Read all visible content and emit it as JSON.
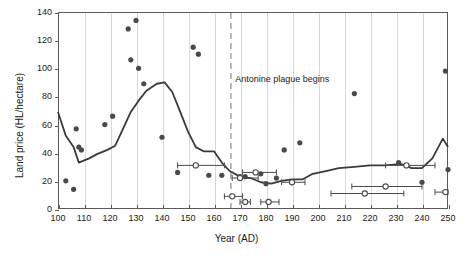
{
  "chart_data": {
    "type": "scatter",
    "title": "",
    "xlabel": "Year (AD)",
    "ylabel": "Land price (HL/hectare)",
    "xlim": [
      100,
      250
    ],
    "ylim": [
      0,
      140
    ],
    "xticks": [
      100,
      110,
      120,
      130,
      140,
      150,
      160,
      170,
      180,
      190,
      200,
      210,
      220,
      230,
      240,
      250
    ],
    "yticks": [
      0,
      20,
      40,
      60,
      80,
      100,
      120,
      140
    ],
    "grid": "vertical",
    "legend": "none",
    "annotations": [
      {
        "text": "Antonine plague begins",
        "x": 167,
        "y": 92,
        "line_x": 166.5,
        "style": "dashed-vertical-gray"
      }
    ],
    "series": [
      {
        "name": "Trend line",
        "type": "line",
        "color": "#3a3a3a",
        "points": [
          [
            100,
            69
          ],
          [
            103,
            52
          ],
          [
            106,
            44
          ],
          [
            108,
            33
          ],
          [
            112,
            36
          ],
          [
            115,
            39
          ],
          [
            119,
            42
          ],
          [
            122,
            45
          ],
          [
            125,
            57
          ],
          [
            128,
            69
          ],
          [
            131,
            77
          ],
          [
            134,
            84
          ],
          [
            138,
            89
          ],
          [
            141,
            90
          ],
          [
            144,
            83
          ],
          [
            147,
            69
          ],
          [
            150,
            55
          ],
          [
            153,
            44
          ],
          [
            156,
            41
          ],
          [
            160,
            41
          ],
          [
            163,
            33
          ],
          [
            166,
            27
          ],
          [
            170,
            23
          ],
          [
            174,
            22
          ],
          [
            178,
            19
          ],
          [
            182,
            18
          ],
          [
            186,
            20
          ],
          [
            190,
            21
          ],
          [
            194,
            21
          ],
          [
            198,
            25
          ],
          [
            203,
            27
          ],
          [
            208,
            29
          ],
          [
            214,
            30
          ],
          [
            220,
            31
          ],
          [
            226,
            31
          ],
          [
            232,
            32
          ],
          [
            236,
            29
          ],
          [
            240,
            29
          ],
          [
            244,
            36
          ],
          [
            248,
            50
          ],
          [
            250,
            44
          ]
        ]
      },
      {
        "name": "Observed land prices (filled)",
        "type": "scatter",
        "marker": "filled-circle",
        "color": "#4a4a4a",
        "points": [
          [
            103,
            20
          ],
          [
            106,
            14
          ],
          [
            107,
            57
          ],
          [
            108,
            44
          ],
          [
            109,
            42
          ],
          [
            118,
            60
          ],
          [
            121,
            66
          ],
          [
            127,
            128
          ],
          [
            128,
            106
          ],
          [
            130,
            134
          ],
          [
            131,
            100
          ],
          [
            133,
            89
          ],
          [
            140,
            51
          ],
          [
            146,
            26
          ],
          [
            152,
            115
          ],
          [
            154,
            110
          ],
          [
            158,
            24
          ],
          [
            163,
            24
          ],
          [
            170,
            23
          ],
          [
            172,
            23
          ],
          [
            178,
            25
          ],
          [
            180,
            18
          ],
          [
            184,
            22
          ],
          [
            187,
            42
          ],
          [
            190,
            19
          ],
          [
            193,
            47
          ],
          [
            214,
            82
          ],
          [
            231,
            33
          ],
          [
            240,
            19
          ],
          [
            249,
            98
          ],
          [
            250,
            28
          ]
        ]
      },
      {
        "name": "Price range estimates (open)",
        "type": "scatter-with-range",
        "marker": "open-circle",
        "color": "#4a4a4a",
        "points": [
          {
            "x": 153,
            "y": 31,
            "x_low": 146,
            "x_high": 164
          },
          {
            "x": 167,
            "y": 9,
            "x_low": 164,
            "x_high": 171
          },
          {
            "x": 170,
            "y": 22,
            "x_low": 167,
            "x_high": 177
          },
          {
            "x": 172,
            "y": 5,
            "x_low": 170,
            "x_high": 174
          },
          {
            "x": 176,
            "y": 26,
            "x_low": 171,
            "x_high": 184
          },
          {
            "x": 181,
            "y": 5,
            "x_low": 178,
            "x_high": 185
          },
          {
            "x": 190,
            "y": 19,
            "x_low": 186,
            "x_high": 195
          },
          {
            "x": 218,
            "y": 11,
            "x_low": 205,
            "x_high": 233
          },
          {
            "x": 226,
            "y": 16,
            "x_low": 213,
            "x_high": 240
          },
          {
            "x": 234,
            "y": 31,
            "x_low": 226,
            "x_high": 245
          },
          {
            "x": 249,
            "y": 12,
            "x_low": 245,
            "x_high": 250
          }
        ]
      }
    ]
  }
}
